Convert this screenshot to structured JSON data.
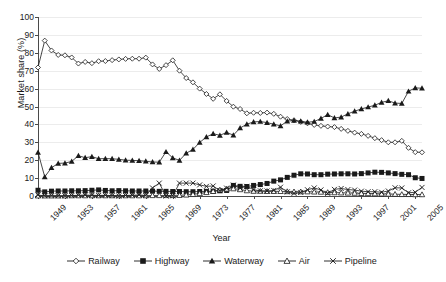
{
  "chart_data": {
    "type": "line",
    "title": "",
    "xlabel": "Year",
    "ylabel": "Market share (%)",
    "ylim": [
      0,
      100
    ],
    "ytick_labels": [
      "0",
      "10",
      "20",
      "30",
      "40",
      "50",
      "60",
      "70",
      "80",
      "90",
      "100"
    ],
    "ytick_values": [
      0,
      10,
      20,
      30,
      40,
      50,
      60,
      70,
      80,
      90,
      100
    ],
    "grid": "horizontal",
    "legend_position": "bottom",
    "x_tick_labels": [
      "1949",
      "1953",
      "1957",
      "1961",
      "1965",
      "1969",
      "1973",
      "1977",
      "1981",
      "1985",
      "1989",
      "1993",
      "1997",
      "2001",
      "2005"
    ],
    "x": [
      1949,
      1950,
      1951,
      1952,
      1953,
      1954,
      1955,
      1956,
      1957,
      1958,
      1959,
      1960,
      1961,
      1962,
      1963,
      1964,
      1965,
      1966,
      1967,
      1968,
      1969,
      1970,
      1971,
      1972,
      1973,
      1974,
      1975,
      1976,
      1977,
      1978,
      1979,
      1980,
      1981,
      1982,
      1983,
      1984,
      1985,
      1986,
      1987,
      1988,
      1989,
      1990,
      1991,
      1992,
      1993,
      1994,
      1995,
      1996,
      1997,
      1998,
      1999,
      2000,
      2001,
      2002,
      2003,
      2004,
      2005,
      2006
    ],
    "series": [
      {
        "name": "Railway",
        "marker": "open-diamond",
        "color": "#1a1a1a",
        "values": [
          71.8,
          86.8,
          81.3,
          78.8,
          78.6,
          77.4,
          74.0,
          74.9,
          74.2,
          75.3,
          75.4,
          75.9,
          76.3,
          76.6,
          76.7,
          76.7,
          77.3,
          73.5,
          71.0,
          73.1,
          75.8,
          70.0,
          65.9,
          63.5,
          60.0,
          57.0,
          54.3,
          56.8,
          53.1,
          49.9,
          48.6,
          46.2,
          46.5,
          46.4,
          46.6,
          45.9,
          44.3,
          43.0,
          42.3,
          41.4,
          40.6,
          39.7,
          39.2,
          38.8,
          38.5,
          37.5,
          36.4,
          35.4,
          34.7,
          33.6,
          32.3,
          31.2,
          30.0,
          30.0,
          30.8,
          26.9,
          24.5,
          24.4
        ]
      },
      {
        "name": "Highway",
        "marker": "filled-square",
        "color": "#1a1a1a",
        "values": [
          3.2,
          2.3,
          2.7,
          2.8,
          2.8,
          2.9,
          2.9,
          3.0,
          3.2,
          3.4,
          3.1,
          2.9,
          3.0,
          2.9,
          2.8,
          2.8,
          2.8,
          2.7,
          2.6,
          2.6,
          2.5,
          2.5,
          2.4,
          2.4,
          2.5,
          2.6,
          2.7,
          2.9,
          3.1,
          5.9,
          5.4,
          5.3,
          5.9,
          6.4,
          7.0,
          8.3,
          9.0,
          10.4,
          11.6,
          12.4,
          12.3,
          11.9,
          11.9,
          12.2,
          12.3,
          12.4,
          12.4,
          12.3,
          12.5,
          12.9,
          13.3,
          13.2,
          12.9,
          12.5,
          12.1,
          11.9,
          10.2,
          9.8
        ]
      },
      {
        "name": "Waterway",
        "marker": "filled-triangle",
        "color": "#1a1a1a",
        "values": [
          24.4,
          10.7,
          15.8,
          18.2,
          18.4,
          19.3,
          22.5,
          21.4,
          22.0,
          20.8,
          20.9,
          20.8,
          20.5,
          20.0,
          19.9,
          19.7,
          19.4,
          19.0,
          18.9,
          24.7,
          21.3,
          19.9,
          23.9,
          26.0,
          29.9,
          33.0,
          34.8,
          33.9,
          35.5,
          34.0,
          38.0,
          40.1,
          41.4,
          41.6,
          41.0,
          40.1,
          39.2,
          41.8,
          42.2,
          41.8,
          41.2,
          41.6,
          43.3,
          45.5,
          43.6,
          44.1,
          45.9,
          47.4,
          48.6,
          49.7,
          50.7,
          52.3,
          53.2,
          51.9,
          51.7,
          58.5,
          60.4,
          60.2
        ]
      },
      {
        "name": "Air",
        "marker": "open-triangle",
        "color": "#1a1a1a",
        "values": [
          0.1,
          0.1,
          0.1,
          0.1,
          0.1,
          0.2,
          0.2,
          0.2,
          0.2,
          0.2,
          0.2,
          0.2,
          0.2,
          0.2,
          0.2,
          0.2,
          0.2,
          0.3,
          0.3,
          0.3,
          0.3,
          0.4,
          0.6,
          0.9,
          1.4,
          2.0,
          2.6,
          3.4,
          3.9,
          4.1,
          3.6,
          3.0,
          2.7,
          2.7,
          2.6,
          2.6,
          2.6,
          2.5,
          2.4,
          2.4,
          2.4,
          2.3,
          2.2,
          2.0,
          1.9,
          1.8,
          1.7,
          1.6,
          1.5,
          1.4,
          1.3,
          1.2,
          1.1,
          1.0,
          0.9,
          0.9,
          0.8,
          0.8
        ]
      },
      {
        "name": "Pipeline",
        "marker": "x",
        "color": "#1a1a1a",
        "values": [
          0.5,
          0.1,
          0.1,
          0.1,
          0.1,
          0.2,
          0.4,
          0.5,
          0.4,
          0.3,
          0.4,
          0.2,
          0.0,
          0.3,
          0.4,
          0.6,
          0.3,
          4.5,
          7.2,
          0.0,
          0.1,
          7.2,
          7.2,
          7.2,
          6.2,
          5.4,
          5.6,
          3.0,
          4.4,
          6.1,
          4.4,
          5.4,
          3.5,
          2.9,
          2.8,
          3.1,
          4.9,
          2.3,
          1.5,
          2.0,
          3.5,
          4.5,
          3.4,
          1.5,
          3.7,
          4.2,
          3.6,
          3.3,
          2.7,
          2.4,
          2.4,
          2.1,
          2.8,
          4.6,
          4.5,
          1.8,
          2.1,
          4.8
        ]
      }
    ]
  },
  "legend": {
    "items": [
      {
        "label": "Railway"
      },
      {
        "label": "Highway"
      },
      {
        "label": "Waterway"
      },
      {
        "label": "Air"
      },
      {
        "label": "Pipeline"
      }
    ]
  }
}
